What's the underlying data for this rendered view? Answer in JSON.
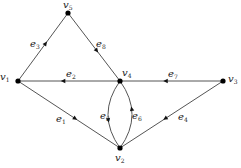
{
  "diagram": {
    "type": "directed-graph",
    "colors": {
      "edge": "#555555",
      "node": "#000000",
      "text": "#222222",
      "background": "#ffffff"
    },
    "nodes": [
      {
        "id": "v1",
        "base": "v",
        "sub": "1",
        "x": 18,
        "y": 81,
        "lx": 0,
        "ly": 72
      },
      {
        "id": "v2",
        "base": "v",
        "sub": "2",
        "x": 120,
        "y": 148,
        "lx": 115,
        "ly": 153
      },
      {
        "id": "v3",
        "base": "v",
        "sub": "3",
        "x": 223,
        "y": 81,
        "lx": 228,
        "ly": 74
      },
      {
        "id": "v4",
        "base": "v",
        "sub": "4",
        "x": 120,
        "y": 81,
        "lx": 122,
        "ly": 68
      },
      {
        "id": "v5",
        "base": "v",
        "sub": "5",
        "x": 68,
        "y": 13,
        "lx": 63,
        "ly": 0
      }
    ],
    "edges": [
      {
        "id": "e1",
        "base": "e",
        "sub": "1",
        "from": "v1",
        "to": "v2",
        "lx": 56,
        "ly": 114
      },
      {
        "id": "e2",
        "base": "e",
        "sub": "2",
        "from": "v4",
        "to": "v1",
        "lx": 66,
        "ly": 69
      },
      {
        "id": "e3",
        "base": "e",
        "sub": "3",
        "from": "v1",
        "to": "v5",
        "lx": 30,
        "ly": 39
      },
      {
        "id": "e4",
        "base": "e",
        "sub": "4",
        "from": "v3",
        "to": "v2",
        "lx": 178,
        "ly": 112
      },
      {
        "id": "e5",
        "base": "e",
        "sub": "5",
        "from": "v4",
        "to": "v2",
        "curve": "left",
        "lx": 100,
        "ly": 111
      },
      {
        "id": "e6",
        "base": "e",
        "sub": "6",
        "from": "v2",
        "to": "v4",
        "curve": "right",
        "lx": 132,
        "ly": 111
      },
      {
        "id": "e7",
        "base": "e",
        "sub": "7",
        "from": "v3",
        "to": "v4",
        "lx": 168,
        "ly": 69
      },
      {
        "id": "e8",
        "base": "e",
        "sub": "8",
        "from": "v5",
        "to": "v4",
        "lx": 96,
        "ly": 39
      }
    ]
  }
}
